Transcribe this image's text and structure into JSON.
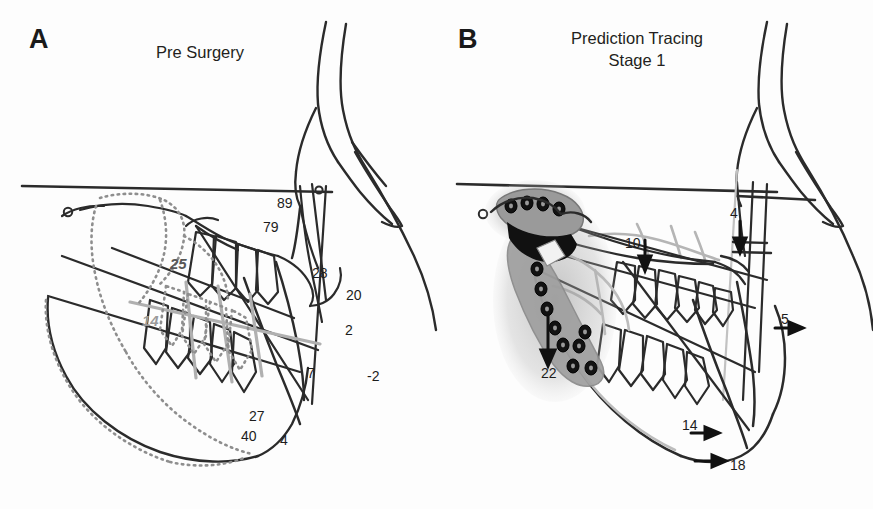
{
  "figure": {
    "width": 873,
    "height": 509,
    "background": "#ffffff"
  },
  "colors": {
    "ink": "#1c1c1c",
    "trace_black": "#2b2b2b",
    "trace_gray_dark": "#6e6e6e",
    "trace_gray_light": "#b3b3b3",
    "dotted_gray": "#8e8e8e",
    "implant_fill": "#9a9a9a",
    "implant_screw": "#111111",
    "label_gray_dark": "#575757",
    "label_gray_light": "#9a9a9a"
  },
  "panels": [
    {
      "id": "a",
      "letter": "A",
      "title": "Pre Surgery",
      "title_lines": [
        "Pre Surgery"
      ],
      "measurements": [
        {
          "label": "89",
          "x": 277,
          "y": 196,
          "style": "black",
          "note": "cranial-base reference angle"
        },
        {
          "label": "79",
          "x": 263,
          "y": 220,
          "style": "black",
          "note": "maxillary angle"
        },
        {
          "label": "25",
          "x": 170,
          "y": 256,
          "style": "gray-dark",
          "note": "gray measurement"
        },
        {
          "label": "28",
          "x": 312,
          "y": 266,
          "style": "black",
          "note": "incisor angle"
        },
        {
          "label": "20",
          "x": 346,
          "y": 288,
          "style": "black",
          "note": ""
        },
        {
          "label": "14",
          "x": 142,
          "y": 313,
          "style": "gray-light",
          "note": "light gray measurement"
        },
        {
          "label": "2",
          "x": 345,
          "y": 323,
          "style": "black",
          "note": ""
        },
        {
          "label": "7",
          "x": 307,
          "y": 366,
          "style": "black",
          "note": ""
        },
        {
          "label": "-2",
          "x": 367,
          "y": 369,
          "style": "black",
          "note": "negative value"
        },
        {
          "label": "27",
          "x": 249,
          "y": 409,
          "style": "black",
          "note": ""
        },
        {
          "label": "40",
          "x": 241,
          "y": 429,
          "style": "black",
          "note": ""
        },
        {
          "label": "4",
          "x": 280,
          "y": 433,
          "style": "black",
          "note": ""
        }
      ],
      "arrows": []
    },
    {
      "id": "b",
      "letter": "B",
      "title": "Prediction Tracing Stage 1",
      "title_lines": [
        "Prediction Tracing",
        "Stage 1"
      ],
      "measurements": [
        {
          "label": "4",
          "x": 730,
          "y": 206,
          "style": "black",
          "note": "with down arrow"
        },
        {
          "label": "10",
          "x": 625,
          "y": 236,
          "style": "black",
          "note": "with down arrow"
        },
        {
          "label": "5",
          "x": 781,
          "y": 312,
          "style": "black",
          "note": "with right arrow"
        },
        {
          "label": "22",
          "x": 541,
          "y": 366,
          "style": "black",
          "note": "with long down arrow"
        },
        {
          "label": "14",
          "x": 682,
          "y": 418,
          "style": "black",
          "note": "with right arrow"
        },
        {
          "label": "18",
          "x": 730,
          "y": 458,
          "style": "black",
          "note": "with right arrow"
        }
      ],
      "arrows": [
        {
          "for": "4",
          "direction": "down",
          "x1": 740,
          "y1": 218,
          "x2": 740,
          "y2": 243
        },
        {
          "for": "10",
          "direction": "down",
          "x1": 645,
          "y1": 238,
          "x2": 645,
          "y2": 262
        },
        {
          "for": "5",
          "direction": "right",
          "x1": 776,
          "y1": 327,
          "x2": 800,
          "y2": 327
        },
        {
          "for": "22",
          "direction": "down",
          "x1": 548,
          "y1": 315,
          "x2": 548,
          "y2": 364
        },
        {
          "for": "14",
          "direction": "right",
          "x1": 690,
          "y1": 432,
          "x2": 714,
          "y2": 432
        },
        {
          "for": "18",
          "direction": "right",
          "x1": 695,
          "y1": 460,
          "x2": 723,
          "y2": 460
        }
      ],
      "implant": {
        "name": "mandibular distraction device",
        "screws": 13
      }
    }
  ],
  "caption": {
    "text": " ",
    "visible": false
  }
}
